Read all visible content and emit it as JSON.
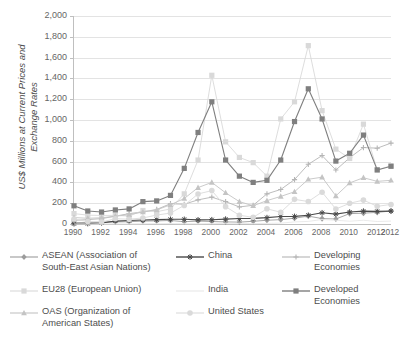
{
  "chart_data": {
    "type": "line",
    "title": "",
    "xlabel": "",
    "ylabel": "US$ Millions at Current Prices and Exchange Rates",
    "ylabel_line1": "US$ Millions at Current Prices and",
    "ylabel_line2": "Exchange Rates",
    "ylim": [
      0,
      2000
    ],
    "ytick_step": 200,
    "yticks": [
      "0",
      "200",
      "400",
      "600",
      "800",
      "1,000",
      "1,200",
      "1,400",
      "1,600",
      "1,800",
      "2,000"
    ],
    "grid": true,
    "legend_position": "bottom",
    "x": [
      1990,
      1991,
      1992,
      1993,
      1994,
      1995,
      1996,
      1997,
      1998,
      1999,
      2000,
      2001,
      2002,
      2003,
      2004,
      2005,
      2006,
      2007,
      2008,
      2009,
      2010,
      2011,
      2012,
      2013
    ],
    "xtick_labels": [
      "1990",
      "1992",
      "1994",
      "1996",
      "1998",
      "2000",
      "2002",
      "2004",
      "2006",
      "2008",
      "2010",
      "2012",
      "2012"
    ],
    "xtick_years": [
      1990,
      1992,
      1994,
      1996,
      1998,
      2000,
      2002,
      2004,
      2006,
      2008,
      2010,
      2012,
      2013
    ],
    "series": [
      {
        "name": "ASEAN (Association of South-East Asian Nations)",
        "legend_label": "ASEAN (Association of\nSouth-East Asian Nations)",
        "color": "#9c9c9c",
        "marker": "diamond",
        "values": [
          13,
          15,
          17,
          20,
          22,
          28,
          30,
          34,
          22,
          28,
          24,
          20,
          18,
          26,
          36,
          42,
          56,
          76,
          52,
          48,
          100,
          104,
          112,
          125
        ]
      },
      {
        "name": "China",
        "legend_label": "China",
        "color": "#4a4a4a",
        "marker": "star",
        "values": [
          3,
          4,
          11,
          28,
          34,
          38,
          42,
          45,
          45,
          40,
          41,
          47,
          53,
          54,
          61,
          72,
          73,
          84,
          108,
          95,
          115,
          124,
          121,
          124
        ]
      },
      {
        "name": "Developing Economies",
        "legend_label": "Developing Economies",
        "color": "#b5b5b5",
        "marker": "plus",
        "values": [
          35,
          42,
          52,
          75,
          100,
          116,
          140,
          195,
          190,
          232,
          258,
          215,
          164,
          180,
          290,
          332,
          427,
          574,
          658,
          519,
          637,
          735,
          729,
          778
        ]
      },
      {
        "name": "EU28 (European Union)",
        "legend_label": "EU28 (European Union)",
        "color": "#d9d9d9",
        "marker": "square",
        "values": [
          100,
          85,
          82,
          83,
          76,
          130,
          118,
          145,
          290,
          615,
          1430,
          790,
          640,
          590,
          460,
          1010,
          1175,
          1715,
          1090,
          720,
          630,
          960,
          520,
          560
        ]
      },
      {
        "name": "India",
        "legend_label": "India",
        "color": "#e8e8e8",
        "marker": "none",
        "values": [
          0,
          0,
          1,
          1,
          1,
          2,
          3,
          4,
          3,
          2,
          4,
          6,
          6,
          4,
          6,
          8,
          20,
          25,
          43,
          36,
          27,
          36,
          24,
          28
        ]
      },
      {
        "name": "Developed Economies",
        "legend_label": "Developed Economies",
        "color": "#7f7f7f",
        "marker": "square-dark",
        "values": [
          175,
          125,
          115,
          135,
          145,
          215,
          222,
          275,
          535,
          880,
          1175,
          615,
          460,
          400,
          420,
          615,
          985,
          1300,
          1010,
          605,
          680,
          855,
          520,
          555
        ]
      },
      {
        "name": "OAS (Organization of American States)",
        "legend_label": "OAS (Organization of\nAmerican States)",
        "color": "#c4c4c4",
        "marker": "triangle",
        "values": [
          62,
          55,
          60,
          75,
          90,
          115,
          135,
          185,
          245,
          350,
          400,
          300,
          215,
          175,
          225,
          265,
          310,
          430,
          450,
          270,
          395,
          445,
          410,
          420
        ]
      },
      {
        "name": "United States",
        "legend_label": "United States",
        "color": "#dadada",
        "marker": "circle",
        "values": [
          48,
          23,
          19,
          51,
          46,
          58,
          86,
          105,
          179,
          289,
          321,
          167,
          84,
          64,
          146,
          113,
          237,
          216,
          306,
          144,
          199,
          230,
          170,
          188
        ]
      }
    ]
  }
}
